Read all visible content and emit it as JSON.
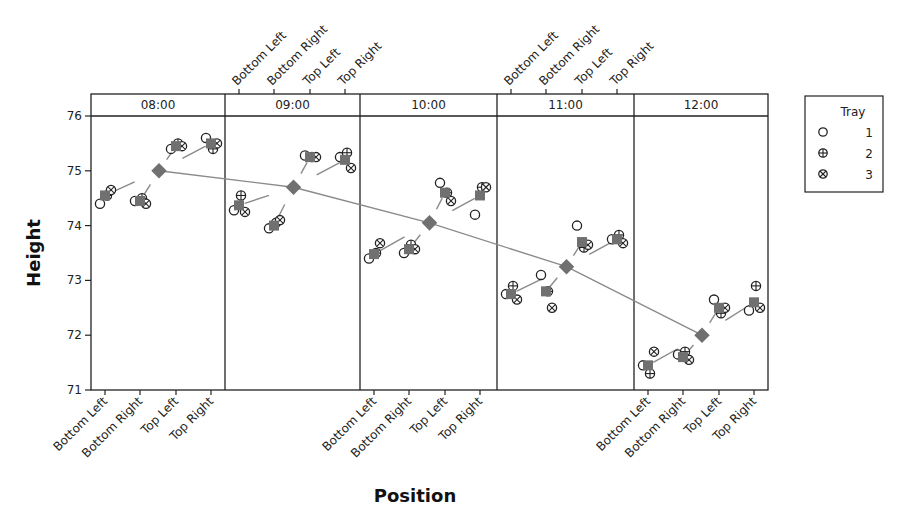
{
  "chart_data": {
    "type": "scatter",
    "title": "",
    "xlabel": "Position",
    "ylabel": "Height",
    "ylim": [
      71,
      76
    ],
    "yticks": [
      71,
      72,
      73,
      74,
      75,
      76
    ],
    "grid": false,
    "legend_position": "right",
    "panel_variable": "Time",
    "panels": [
      "08:00",
      "09:00",
      "10:00",
      "11:00",
      "12:00"
    ],
    "categories": [
      "Bottom Left",
      "Bottom Right",
      "Top Left",
      "Top Right"
    ],
    "top_axis_labels_on_panels": [
      "09:00",
      "11:00"
    ],
    "bottom_axis_labels_on_panels": [
      "08:00",
      "10:00",
      "12:00"
    ],
    "legend": {
      "title": "Tray",
      "entries": [
        {
          "label": "1",
          "symbol": "open-circle"
        },
        {
          "label": "2",
          "symbol": "circle-plus"
        },
        {
          "label": "3",
          "symbol": "circle-x"
        }
      ]
    },
    "series": [
      {
        "name": "1",
        "symbol": "open-circle",
        "values": {
          "08:00": [
            74.4,
            74.45,
            75.4,
            75.6
          ],
          "09:00": [
            74.28,
            73.95,
            75.28,
            75.25
          ],
          "10:00": [
            73.4,
            73.5,
            74.78,
            74.2
          ],
          "11:00": [
            72.75,
            73.1,
            74.0,
            73.75
          ],
          "12:00": [
            71.45,
            71.65,
            72.65,
            72.45
          ]
        }
      },
      {
        "name": "2",
        "symbol": "circle-plus",
        "values": {
          "08:00": [
            74.55,
            74.5,
            75.5,
            75.4
          ],
          "09:00": [
            74.55,
            74.05,
            75.25,
            75.33
          ],
          "10:00": [
            73.5,
            73.65,
            74.6,
            74.7
          ],
          "11:00": [
            72.9,
            72.8,
            73.6,
            73.83
          ],
          "12:00": [
            71.3,
            71.7,
            72.4,
            72.9
          ]
        }
      },
      {
        "name": "3",
        "symbol": "circle-x",
        "values": {
          "08:00": [
            74.65,
            74.4,
            75.45,
            75.5
          ],
          "09:00": [
            74.25,
            74.1,
            75.25,
            75.05
          ],
          "10:00": [
            73.68,
            73.57,
            74.45,
            74.7
          ],
          "11:00": [
            72.65,
            72.5,
            73.65,
            73.68
          ],
          "12:00": [
            71.7,
            71.55,
            72.5,
            72.5
          ]
        }
      }
    ],
    "position_means": {
      "08:00": [
        74.55,
        74.45,
        75.45,
        75.5
      ],
      "09:00": [
        74.37,
        74.0,
        75.25,
        75.2
      ],
      "10:00": [
        73.48,
        73.57,
        74.6,
        74.55
      ],
      "11:00": [
        72.75,
        72.8,
        73.7,
        73.75
      ],
      "12:00": [
        71.45,
        71.6,
        72.5,
        72.6
      ]
    },
    "time_means": {
      "08:00": 75.0,
      "09:00": 74.7,
      "10:00": 74.05,
      "11:00": 73.25,
      "12:00": 72.0
    },
    "colors": {
      "mean_marker": "#707070",
      "mean_line": "#8a8a8a",
      "points": "#222222",
      "frame": "#222222"
    }
  }
}
